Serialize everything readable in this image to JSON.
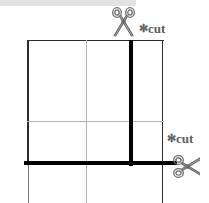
{
  "diagram": {
    "labels": [
      {
        "id": "cut-top",
        "star": "✻",
        "text": "cut",
        "position": "top-right"
      },
      {
        "id": "cut-right",
        "star": "✻",
        "text": "cut",
        "position": "mid-right"
      }
    ],
    "icons": [
      {
        "name": "scissors-icon",
        "orientation": "vertical",
        "position": "top"
      },
      {
        "name": "scissors-icon",
        "orientation": "horizontal",
        "position": "right"
      }
    ],
    "cut_lines": [
      {
        "name": "vertical-cut-line",
        "orientation": "vertical",
        "color": "#000000"
      },
      {
        "name": "horizontal-cut-line",
        "orientation": "horizontal",
        "color": "#000000"
      }
    ],
    "colors": {
      "cut_line": "#000000",
      "grid_line": "#b3b3b3",
      "border_line": "#2b2b2b",
      "label_text": "#5e5e5e",
      "background": "#ffffff"
    },
    "grid": {
      "vertical_guides": [
        59
      ],
      "horizontal_guides": [
        81
      ],
      "outer_border": true
    }
  }
}
